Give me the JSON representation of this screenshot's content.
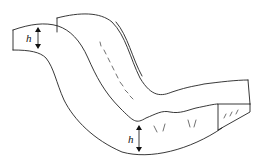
{
  "diagram": {
    "title": "",
    "labels": {
      "upper_height": "h",
      "lower_height": "h"
    },
    "colors": {
      "line": "#222222",
      "background": "#ffffff"
    }
  }
}
